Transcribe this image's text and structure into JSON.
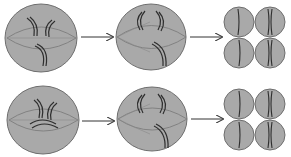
{
  "colors": {
    "cell_fill": "#a9a9a9",
    "cell_stroke": "#6e6e6e",
    "spindle": "#7a7a7a",
    "chromosome": "#2f2f2f",
    "arrow": "#333333",
    "background": "#ffffff"
  },
  "rows": [
    {
      "name": "row-1",
      "stages": [
        {
          "name": "stage-1",
          "type": "large-cell",
          "description": "Cell with spindle and chromosomes"
        },
        {
          "name": "stage-2",
          "type": "large-cell",
          "description": "Cell with separating chromosomes"
        },
        {
          "name": "stage-3",
          "type": "four-cells",
          "description": "Four daughter cells"
        }
      ]
    },
    {
      "name": "row-2",
      "stages": [
        {
          "name": "stage-1",
          "type": "large-cell",
          "description": "Cell with crossed chromosomes"
        },
        {
          "name": "stage-2",
          "type": "large-cell",
          "description": "Cell with separating chromosomes"
        },
        {
          "name": "stage-3",
          "type": "four-cells",
          "description": "Four daughter cells"
        }
      ]
    }
  ]
}
